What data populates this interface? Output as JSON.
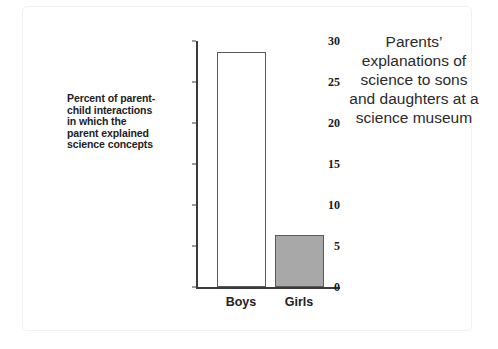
{
  "chart_data": {
    "type": "bar",
    "title": "Parents’ explanations of science to sons and daughters at a science museum",
    "categories": [
      "Boys",
      "Girls"
    ],
    "values": [
      28.7,
      6.3
    ],
    "xlabel": "",
    "ylabel": "Percent of parent-child interactions in which the parent explained science concepts",
    "ylim": [
      0,
      30
    ],
    "yticks": [
      0,
      5,
      10,
      15,
      20,
      25,
      30
    ],
    "ytick_labels": [
      "0",
      "5",
      "10",
      "15",
      "20",
      "25",
      "30"
    ],
    "grid": false,
    "legend": "none",
    "bar_styles": [
      {
        "category": "Boys",
        "fill": "#ffffff",
        "edge": "#5a5a5a"
      },
      {
        "category": "Girls",
        "fill": "#a8a8a8",
        "edge": "#5a5a5a"
      }
    ]
  },
  "colors": {
    "boys_fill": "#ffffff",
    "girls_fill": "#a8a8a8",
    "bar_edge": "#5a5a5a",
    "axis": "#3b3b3b",
    "text": "#222222",
    "background": "#ffffff"
  }
}
